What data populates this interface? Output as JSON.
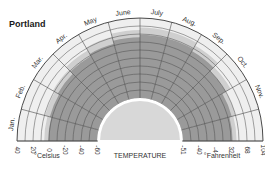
{
  "chart_data": {
    "type": "radial-temperature",
    "title": "Portland",
    "center_label": "TEMPERATURE",
    "months": [
      "Jan.",
      "Feb.",
      "Mar.",
      "Apr.",
      "May",
      "June",
      "July",
      "Aug.",
      "Sep.",
      "Oct.",
      "Nov.",
      "Dec."
    ],
    "celsius_axis": {
      "label": "°Celsius",
      "ticks": [
        40,
        20,
        0,
        -20,
        -40,
        -60
      ]
    },
    "fahrenheit_axis": {
      "label": "°Fahrenheit",
      "ticks": [
        -51,
        -40,
        -4,
        32,
        68,
        104
      ]
    },
    "range_c": [
      -60,
      40
    ],
    "series": [
      {
        "name": "Mean temperature range (dark band top)",
        "unit": "°C",
        "values": [
          1,
          3,
          5,
          9,
          12,
          16,
          19,
          19,
          16,
          10,
          5,
          2
        ]
      },
      {
        "name": "Extreme temperature (light band top)",
        "unit": "°C",
        "values": [
          6,
          9,
          12,
          17,
          21,
          25,
          28,
          28,
          24,
          17,
          10,
          7
        ]
      }
    ],
    "grid": true,
    "ring_step_c": 10
  },
  "colors": {
    "dark_band": "#9a9a9a",
    "light_band": "#cfcfcf",
    "outer": "#efefef",
    "center_fill": "#d8d8d8",
    "grid": "#4a4a4a"
  }
}
